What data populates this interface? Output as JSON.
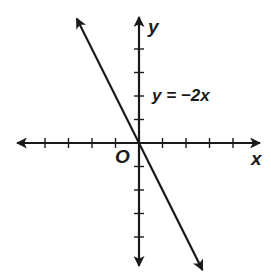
{
  "chart_data": {
    "type": "line",
    "title": "",
    "equation_label": "y = −2x",
    "xlabel": "x",
    "ylabel": "y",
    "origin_label": "O",
    "xlim": [
      -5,
      5
    ],
    "ylim": [
      -5,
      5
    ],
    "x_ticks": [
      -4,
      -3,
      -2,
      -1,
      1,
      2,
      3,
      4
    ],
    "y_ticks": [
      -4,
      -3,
      -2,
      -1,
      1,
      2,
      3,
      4
    ],
    "tick_labels_shown": false,
    "grid": false,
    "series": [
      {
        "name": "y = −2x",
        "slope": -2,
        "intercept": 0,
        "x": [
          -2.65,
          2.7
        ],
        "y": [
          5.3,
          -5.4
        ],
        "arrows_both_ends": true
      }
    ],
    "axes_arrows_both_ends": true
  },
  "colors": {
    "ink": "#1a1a1a",
    "background": "#ffffff"
  }
}
